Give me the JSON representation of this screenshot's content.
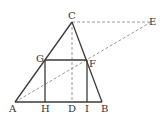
{
  "diagram": {
    "type": "geometry",
    "colors": {
      "solid": "#3a3a3a",
      "dashed": "#9a9a9a",
      "label": "#333333"
    },
    "points": {
      "A": {
        "x": 15,
        "y": 102,
        "label": "A",
        "lx": 9,
        "ly": 112
      },
      "H": {
        "x": 45,
        "y": 102,
        "label": "H",
        "lx": 41,
        "ly": 112
      },
      "D": {
        "x": 72,
        "y": 102,
        "label": "D",
        "lx": 68,
        "ly": 112
      },
      "I": {
        "x": 87,
        "y": 102,
        "label": "I",
        "lx": 85,
        "ly": 112
      },
      "B": {
        "x": 102,
        "y": 102,
        "label": "B",
        "lx": 101,
        "ly": 112
      },
      "C": {
        "x": 72,
        "y": 22,
        "label": "C",
        "lx": 68,
        "ly": 19
      },
      "G": {
        "x": 45,
        "y": 60,
        "label": "G",
        "lx": 36,
        "ly": 62
      },
      "F": {
        "x": 87,
        "y": 60,
        "label": "F",
        "lx": 89,
        "ly": 67
      },
      "E": {
        "x": 151,
        "y": 22,
        "label": "E",
        "lx": 149,
        "ly": 25
      }
    },
    "solid_segments": [
      [
        "A",
        "B"
      ],
      [
        "A",
        "C"
      ],
      [
        "C",
        "B"
      ],
      [
        "G",
        "F"
      ],
      [
        "G",
        "H"
      ],
      [
        "F",
        "I"
      ]
    ],
    "dashed_segments": [
      [
        "C",
        "E"
      ],
      [
        "C",
        "D"
      ],
      [
        "A",
        "E"
      ]
    ]
  }
}
